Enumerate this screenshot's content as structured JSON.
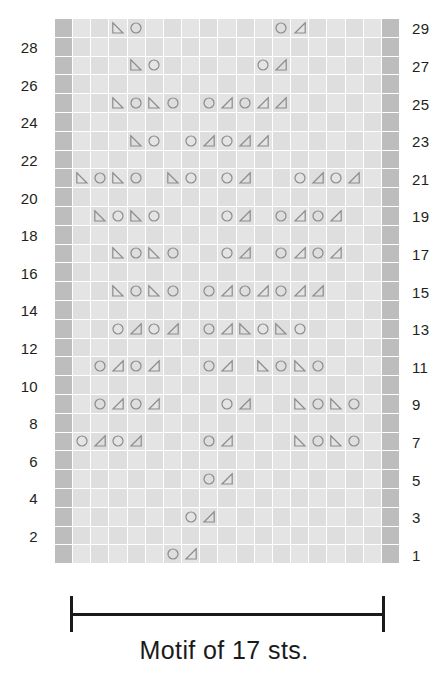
{
  "chart_data": {
    "type": "table",
    "title": "Motif of 17 sts.",
    "subtitle": "",
    "xlabel": "",
    "ylabel": "",
    "grid": true,
    "legend_position": "none",
    "columns": 19,
    "stitch_columns": 17,
    "rows": 30,
    "edge_columns": [
      0,
      18
    ],
    "row_number_side_left": "even",
    "row_number_side_right": "odd",
    "symbols": {
      "O": "yarn-over-circle",
      "L": "left-leaning-decrease-triangle",
      "R": "right-leaning-decrease-triangle",
      ".": "empty-knit-stitch"
    },
    "row_labels_left": [
      "28",
      "26",
      "24",
      "22",
      "20",
      "18",
      "16",
      "14",
      "12",
      "10",
      "8",
      "6",
      "4",
      "2"
    ],
    "row_labels_right": [
      "29",
      "27",
      "25",
      "23",
      "21",
      "19",
      "17",
      "15",
      "13",
      "11",
      "9",
      "7",
      "5",
      "3",
      "1"
    ],
    "rows_data": [
      {
        "number": 29,
        "side": "right",
        "cells": "..LO.......OR...."
      },
      {
        "number": 28,
        "side": "left",
        "cells": "................."
      },
      {
        "number": 27,
        "side": "right",
        "cells": "...LO.....OR....."
      },
      {
        "number": 26,
        "side": "left",
        "cells": "................."
      },
      {
        "number": 25,
        "side": "right",
        "cells": "..LOLO.ORORR....."
      },
      {
        "number": 24,
        "side": "left",
        "cells": "................."
      },
      {
        "number": 23,
        "side": "right",
        "cells": "...LO.ORORR......"
      },
      {
        "number": 22,
        "side": "left",
        "cells": "................."
      },
      {
        "number": 21,
        "side": "right",
        "cells": "LOLO.LO.OR..OROR."
      },
      {
        "number": 20,
        "side": "left",
        "cells": "................."
      },
      {
        "number": 19,
        "side": "right",
        "cells": ".LOLO...OR.OROR.."
      },
      {
        "number": 18,
        "side": "left",
        "cells": "................."
      },
      {
        "number": 17,
        "side": "right",
        "cells": "..LOLO..OR.OROR.."
      },
      {
        "number": 16,
        "side": "left",
        "cells": "................."
      },
      {
        "number": 15,
        "side": "right",
        "cells": "..LOLO.ORORORR..."
      },
      {
        "number": 14,
        "side": "left",
        "cells": "................."
      },
      {
        "number": 13,
        "side": "right",
        "cells": "..OROR.ORLOLO...."
      },
      {
        "number": 12,
        "side": "left",
        "cells": "................."
      },
      {
        "number": 11,
        "side": "right",
        "cells": ".OROR..OR.LOLO..."
      },
      {
        "number": 10,
        "side": "left",
        "cells": "................."
      },
      {
        "number": 9,
        "side": "right",
        "cells": ".OROR...OR..LOLO."
      },
      {
        "number": 8,
        "side": "left",
        "cells": "................."
      },
      {
        "number": 7,
        "side": "right",
        "cells": "OROR...OR...LOLO."
      },
      {
        "number": 6,
        "side": "left",
        "cells": "................."
      },
      {
        "number": 5,
        "side": "right",
        "cells": ".......OR........"
      },
      {
        "number": 4,
        "side": "left",
        "cells": "................."
      },
      {
        "number": 3,
        "side": "right",
        "cells": "......OR........."
      },
      {
        "number": 2,
        "side": "left",
        "cells": "................."
      },
      {
        "number": 1,
        "side": "right",
        "cells": ".....OR.........."
      }
    ],
    "colors": {
      "edge_cell": "#bdbdbd",
      "stitch_cell": "#e2e2e2",
      "gridline": "#ffffff",
      "symbol_stroke": "#8c8c8c",
      "text": "#231f20",
      "bracket": "#1a1a1a",
      "background": "#ffffff"
    }
  },
  "caption": {
    "text": "Motif of 17 sts."
  }
}
